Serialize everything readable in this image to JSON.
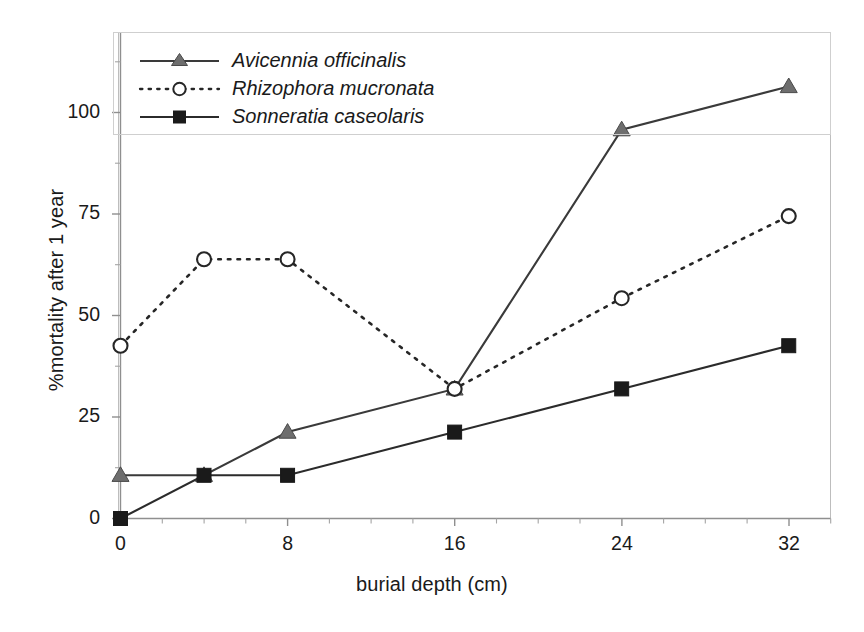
{
  "chart_data": {
    "type": "line",
    "title": "",
    "xlabel": "burial depth (cm)",
    "ylabel": "%mortality after 1 year",
    "x": [
      0,
      4,
      8,
      16,
      24,
      32
    ],
    "xlim": [
      0,
      34
    ],
    "ylim": [
      0,
      112.5
    ],
    "xticks": [
      0,
      8,
      16,
      24,
      32
    ],
    "xtick_labels": [
      "0",
      "8",
      "16",
      "24",
      "32"
    ],
    "xtick_minor_step": 2,
    "yticks": [
      0,
      25,
      50,
      75,
      100
    ],
    "ytick_labels": [
      "0",
      "25",
      "50",
      "75",
      "100"
    ],
    "ytick_minor_step": 12.5,
    "grid": false,
    "legend_position": "top-left-inside",
    "frame": true,
    "series": [
      {
        "name": "Avicennia officinalis",
        "marker": "triangle",
        "marker_fill": "#6e6e6e",
        "line_style": "solid",
        "color": "#3a3a3a",
        "values": [
          10,
          10,
          20,
          30,
          90,
          100
        ]
      },
      {
        "name": "Rhizophora mucronata",
        "marker": "circle-open",
        "marker_fill": "#ffffff",
        "line_style": "dotted",
        "color": "#262626",
        "values": [
          40,
          60,
          60,
          30,
          51,
          70
        ]
      },
      {
        "name": "Sonneratia caseolaris",
        "marker": "square",
        "marker_fill": "#1a1a1a",
        "line_style": "solid",
        "color": "#2b2b2b",
        "values": [
          0,
          10,
          10,
          20,
          30,
          40
        ]
      }
    ]
  },
  "axis": {
    "x_title": "burial depth (cm)",
    "y_title": "%mortality after 1 year",
    "x_ticks": [
      "0",
      "8",
      "16",
      "24",
      "32"
    ],
    "y_ticks": [
      "100",
      "75",
      "50",
      "25",
      "0"
    ]
  },
  "legend": {
    "entries": [
      {
        "label": "Avicennia officinalis"
      },
      {
        "label": "Rhizophora mucronata"
      },
      {
        "label": "Sonneratia caseolaris"
      }
    ]
  },
  "colors": {
    "axis": "#8c8c8c",
    "frame": "#b4b4b4",
    "text": "#1a1a1a",
    "series_triangle": "#6e6e6e",
    "series_circle": "#262626",
    "series_square": "#1a1a1a",
    "background": "#ffffff"
  }
}
